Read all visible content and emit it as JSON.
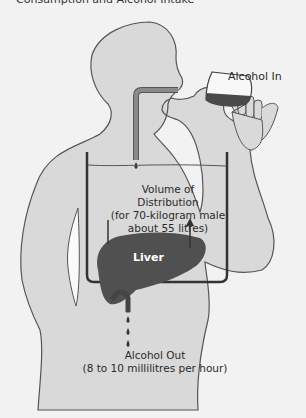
{
  "title": "Consumption and Alcohol Intake",
  "labels": {
    "alcohol_in": "Alcohol In",
    "volume_line1": "Volume of",
    "volume_line2": "Distribution",
    "volume_line3": "(for 70-kilogram male",
    "volume_line4": "about 55 litres)",
    "liver": "Liver",
    "alcohol_out_line1": "Alcohol Out",
    "alcohol_out_line2": "(8 to 10 millilitres per hour)"
  },
  "colors": {
    "background": "#f2f2f2",
    "body_fill": "#d9d9d9",
    "outline": "#555555",
    "liver": "#505050",
    "wine": "#4a4a4a",
    "tube": "#8a8a8a",
    "container": "#3a3a3a"
  }
}
